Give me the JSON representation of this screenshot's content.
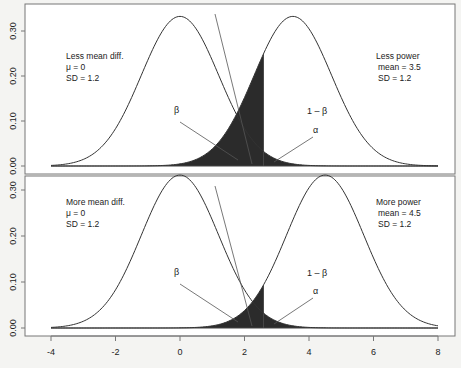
{
  "chart_data": [
    {
      "type": "area",
      "panel": "top",
      "title": "",
      "xlabel": "",
      "ylabel": "",
      "xlim": [
        -4,
        8
      ],
      "ylim": [
        0,
        0.33
      ],
      "y_ticks": [
        "0.00",
        "0.10",
        "0.20",
        "0.30"
      ],
      "x_ticks": [],
      "critical_value": 2.6,
      "series": [
        {
          "name": "Null distribution",
          "mean": 0,
          "sd": 1.2
        },
        {
          "name": "Alternative distribution",
          "mean": 3.5,
          "sd": 1.2
        }
      ],
      "annotations": {
        "left_block": [
          "Less mean diff.",
          "μ = 0",
          "SD = 1.2"
        ],
        "right_block": [
          "Less power",
          "mean = 3.5",
          "SD = 1.2"
        ],
        "beta": "β",
        "power": "1 – β",
        "alpha": "α"
      }
    },
    {
      "type": "area",
      "panel": "bottom",
      "title": "",
      "xlabel": "",
      "ylabel": "",
      "xlim": [
        -4,
        8
      ],
      "ylim": [
        0,
        0.33
      ],
      "y_ticks": [
        "0.00",
        "0.10",
        "0.20",
        "0.30"
      ],
      "x_ticks": [
        "-4",
        "-2",
        "0",
        "2",
        "4",
        "6",
        "8"
      ],
      "critical_value": 2.6,
      "series": [
        {
          "name": "Null distribution",
          "mean": 0,
          "sd": 1.2
        },
        {
          "name": "Alternative distribution",
          "mean": 4.5,
          "sd": 1.2
        }
      ],
      "annotations": {
        "left_block": [
          "More mean diff.",
          "μ = 0",
          "SD = 1.2"
        ],
        "right_block": [
          "More power",
          "mean = 4.5",
          "SD = 1.2"
        ],
        "beta": "β",
        "power": "1 – β",
        "alpha": "α"
      }
    }
  ],
  "colors": {
    "curve": "#333333",
    "shade": "#2b2b2b",
    "frame": "#777777",
    "background": "#f4f4f2"
  }
}
